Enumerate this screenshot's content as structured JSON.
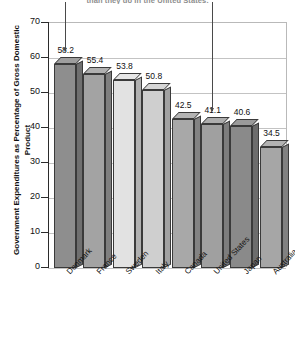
{
  "chart_data": {
    "type": "bar",
    "title": "than they do in the United States.",
    "title_truncated": true,
    "xlabel": "",
    "ylabel": "Government Expenditures as Percentage of Gross Domestic Product",
    "categories": [
      "Denmark",
      "France",
      "Sweden",
      "Italy",
      "Canada",
      "United States",
      "Japan",
      "Australia"
    ],
    "values": [
      58.2,
      55.4,
      53.8,
      50.8,
      42.5,
      41.1,
      40.6,
      34.5
    ],
    "value_labels": [
      "58.2",
      "55.4",
      "53.8",
      "50.8",
      "42.5",
      "41.1",
      "40.6",
      "34.5"
    ],
    "ylim": [
      0,
      70
    ],
    "yticks": [
      70,
      60,
      50,
      40,
      30,
      20,
      10,
      0
    ],
    "ytick_labels": [
      "70",
      "60",
      "50",
      "40",
      "30",
      "20",
      "10",
      "0"
    ],
    "grid": true,
    "legend": null,
    "style": "3d-column",
    "bar_colors": [
      "#8e8e8e",
      "#a3a3a3",
      "#e2e2e2",
      "#cfcfcf",
      "#a8a8a8",
      "#a0a0a0",
      "#8a8a8a",
      "#a6a6a6"
    ],
    "annotations": [
      {
        "name": "arrow-denmark",
        "target": "Denmark"
      },
      {
        "name": "arrow-united-states",
        "target": "United States"
      }
    ]
  },
  "colors": {
    "axis": "#2b2b2b",
    "grid": "#c3c3c3",
    "frame": "#b9b9b9",
    "bar_outline": "#3a3a3a",
    "text": "#111111",
    "title": "#8d8d8d"
  }
}
